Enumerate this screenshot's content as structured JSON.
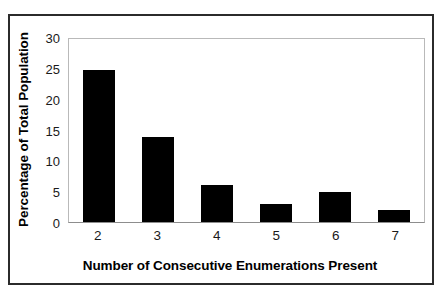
{
  "chart_data": {
    "type": "bar",
    "title": "",
    "subtitle": "",
    "xlabel": "Number of Consecutive Enumerations Present",
    "ylabel": "Percentage of Total Population",
    "categories": [
      "2",
      "3",
      "4",
      "5",
      "6",
      "7"
    ],
    "values": [
      25,
      14,
      6,
      3,
      5,
      2
    ],
    "series": [
      {
        "name": "Percentage of Total Population",
        "values": [
          25,
          14,
          6,
          3,
          5,
          2
        ]
      }
    ],
    "ylim": [
      0,
      30
    ],
    "ytick_labels": [
      "30",
      "25",
      "20",
      "15",
      "10",
      "5",
      "0"
    ],
    "ytick_values": [
      30,
      25,
      20,
      15,
      10,
      5,
      0
    ],
    "ytick_step": 5,
    "grid": false,
    "legend": false,
    "legend_position": "none",
    "bar_color": "#000000",
    "plot_background": "#ffffff",
    "plot_border_color": "#b9b9b9",
    "frame_color": "#2b2b2b",
    "annotations": []
  }
}
